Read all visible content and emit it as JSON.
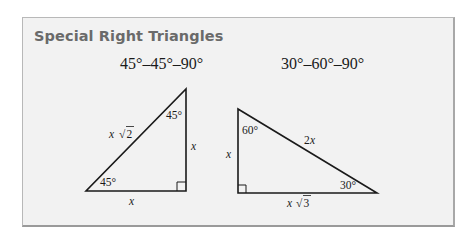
{
  "title": "Special Right Triangles",
  "triangles": [
    {
      "heading": "45°–45°–90°",
      "angles": {
        "top": "45°",
        "bottom_left": "45°"
      },
      "sides": {
        "hypotenuse": "x √2",
        "vertical": "x",
        "horizontal": "x"
      },
      "hyp_var": "x",
      "hyp_root": "2",
      "vert_var": "x",
      "horiz_var": "x"
    },
    {
      "heading": "30°–60°–90°",
      "angles": {
        "top": "60°",
        "bottom_right": "30°"
      },
      "sides": {
        "hypotenuse": "2x",
        "vertical": "x",
        "horizontal": "x √3"
      },
      "hyp_coef": "2",
      "hyp_var": "x",
      "vert_var": "x",
      "horiz_var": "x",
      "horiz_root": "3"
    }
  ],
  "colors": {
    "panel_background": "#f2f2f2",
    "panel_border": "#b8b8b8",
    "title_color": "#6a6a6a",
    "line_color": "#1a1a1a"
  }
}
